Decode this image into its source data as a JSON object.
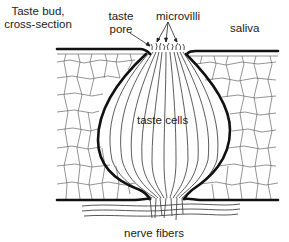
{
  "figure": {
    "title_line1": "Taste bud,",
    "title_line2": "cross-section",
    "labels": {
      "taste_pore_line1": "taste",
      "taste_pore_line2": "pore",
      "microvilli": "microvilli",
      "saliva": "saliva",
      "taste_cells": "taste cells",
      "nerve_fibers": "nerve fibers"
    },
    "colors": {
      "outline": "#111111",
      "cell_lines": "#555555",
      "background": "#ffffff",
      "text": "#222222"
    }
  }
}
